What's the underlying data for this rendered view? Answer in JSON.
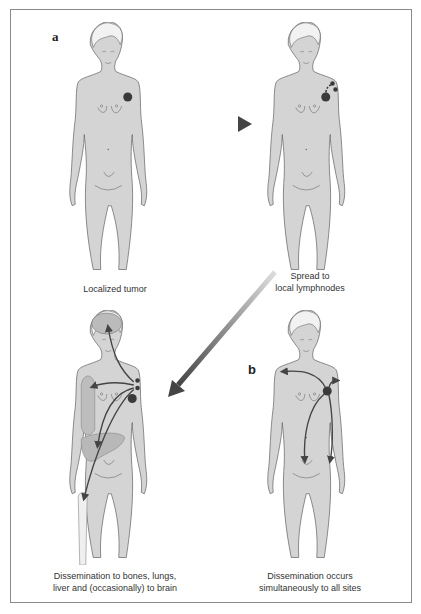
{
  "diagram": {
    "panel_labels": {
      "a": "a",
      "b": "b"
    },
    "figures": [
      {
        "id": "localized",
        "caption_lines": [
          "Localized tumor"
        ]
      },
      {
        "id": "lymph",
        "caption_lines": [
          "Spread to",
          "local lymphnodes"
        ]
      },
      {
        "id": "dissemination-organs",
        "caption_lines": [
          "Dissemination to bones, lungs,",
          "liver and (occasionally) to brain"
        ]
      },
      {
        "id": "dissemination-simultaneous",
        "caption_lines": [
          "Dissemination occurs",
          "simultaneously to all sites"
        ]
      }
    ],
    "colors": {
      "body_fill": "#d4d4d4",
      "outline": "#6a6a6a",
      "tumor": "#3a3a3a",
      "arrow": "#555555",
      "frame": "#8a8a8a"
    }
  }
}
